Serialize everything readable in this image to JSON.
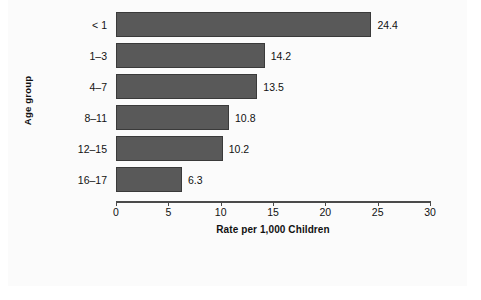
{
  "chart_data": {
    "type": "bar",
    "orientation": "horizontal",
    "title": "",
    "xlabel": "Rate per 1,000 Children",
    "ylabel": "Age group",
    "categories": [
      "< 1",
      "1–3",
      "4–7",
      "8–11",
      "12–15",
      "16–17"
    ],
    "values": [
      24.4,
      14.2,
      13.5,
      10.8,
      10.2,
      6.3
    ],
    "value_labels": [
      "24.4",
      "14.2",
      "13.5",
      "10.8",
      "10.2",
      "6.3"
    ],
    "xlim": [
      0,
      30
    ],
    "xticks": [
      0,
      5,
      10,
      15,
      20,
      25,
      30
    ],
    "xtick_labels": [
      "0",
      "5",
      "10",
      "15",
      "20",
      "25",
      "30"
    ],
    "grid": false,
    "legend": null,
    "colors": {
      "bar_fill": "#595959",
      "bar_border": "#3a3a3a",
      "axis": "#4a4a4a",
      "text": "#111111",
      "panel_background": "#e9e9e9",
      "plot_background": "#fbfbfb"
    }
  }
}
